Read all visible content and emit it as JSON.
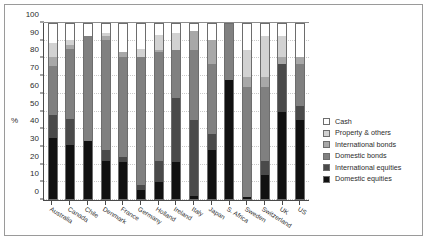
{
  "chart_data": {
    "type": "bar",
    "subtype": "stacked-bar-100",
    "title": "",
    "xlabel": "",
    "ylabel": "%",
    "ylim": [
      0,
      100
    ],
    "yticks": [
      0,
      10,
      20,
      30,
      40,
      50,
      60,
      70,
      80,
      90,
      100
    ],
    "grid": true,
    "legend_position": "right",
    "categories": [
      "Australia",
      "Canada",
      "Chile",
      "Denmark",
      "France",
      "Germany",
      "Holland",
      "Ireland",
      "Italy",
      "Japan",
      "S. Africa",
      "Sweden",
      "Switzerland",
      "UK",
      "US"
    ],
    "series": [
      {
        "name": "Domestic equities",
        "color": "#111111",
        "values": [
          35,
          31,
          33,
          22,
          21,
          5,
          10,
          21,
          2,
          28,
          68,
          1,
          14,
          50,
          45
        ]
      },
      {
        "name": "International equities",
        "color": "#4a4a4a",
        "values": [
          13,
          15,
          0,
          6,
          3,
          3,
          12,
          37,
          43,
          9,
          0,
          0,
          8,
          27,
          8
        ]
      },
      {
        "name": "Domestic bonds",
        "color": "#808080",
        "values": [
          28,
          40,
          60,
          63,
          57,
          73,
          62,
          27,
          40,
          40,
          32,
          63,
          42,
          0,
          24
        ]
      },
      {
        "name": "International bonds",
        "color": "#a8a8a8",
        "values": [
          5,
          2,
          0,
          2,
          3,
          0,
          1,
          0,
          11,
          14,
          0,
          6,
          6,
          4,
          4
        ]
      },
      {
        "name": "Property & others",
        "color": "#d2d2d2",
        "values": [
          8,
          3,
          0,
          2,
          0,
          5,
          9,
          10,
          0,
          0,
          0,
          15,
          23,
          12,
          0
        ]
      },
      {
        "name": "Cash",
        "color": "#ffffff",
        "values": [
          11,
          9,
          7,
          5,
          16,
          14,
          6,
          5,
          4,
          9,
          0,
          15,
          7,
          7,
          19
        ]
      }
    ],
    "legend": [
      {
        "label": "Cash",
        "color": "#ffffff"
      },
      {
        "label": "Property & others",
        "color": "#d2d2d2"
      },
      {
        "label": "International bonds",
        "color": "#a8a8a8"
      },
      {
        "label": "Domestic bonds",
        "color": "#808080"
      },
      {
        "label": "International equities",
        "color": "#4a4a4a"
      },
      {
        "label": "Domestic equities",
        "color": "#111111"
      }
    ]
  }
}
